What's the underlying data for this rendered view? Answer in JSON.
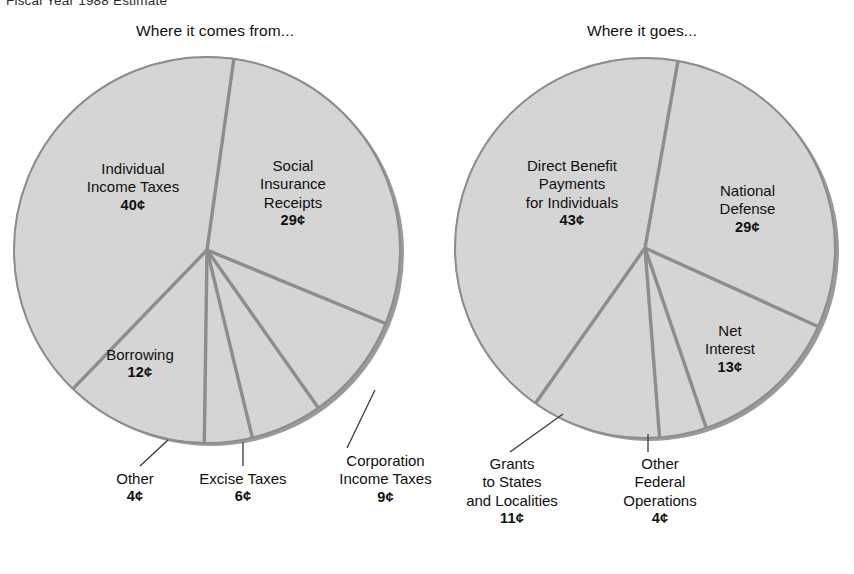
{
  "page": {
    "fiscal_note": "Fiscal Year 1988 Estimate",
    "background_color": "#ffffff",
    "pie_fill_color": "#d5d5d5",
    "pie_divider_color": "#8d8d8d",
    "pie_shadow_color": "#9a9a9a",
    "text_color": "#101010"
  },
  "chart_data": [
    {
      "type": "pie",
      "id": "where-it-comes-from",
      "title": "Where it comes from...",
      "unit": "¢",
      "total": 100,
      "center": [
        207,
        250
      ],
      "radius": 193,
      "categories": [
        "Social Insurance Receipts",
        "Corporation Income Taxes",
        "Excise Taxes",
        "Other",
        "Borrowing",
        "Individual Income Taxes"
      ],
      "values": [
        29,
        9,
        6,
        4,
        12,
        40
      ],
      "slices": [
        {
          "label": "Social Insurance Receipts",
          "label_lines": [
            "Social",
            "Insurance",
            "Receipts"
          ],
          "value": 29,
          "value_text": "29¢",
          "start_angle": 8,
          "end_angle": 112.4,
          "label_placement": "inside"
        },
        {
          "label": "Corporation Income Taxes",
          "label_lines": [
            "Corporation",
            "Income Taxes"
          ],
          "value": 9,
          "value_text": "9¢",
          "start_angle": 112.4,
          "end_angle": 144.8,
          "label_placement": "callout"
        },
        {
          "label": "Excise Taxes",
          "label_lines": [
            "Excise Taxes"
          ],
          "value": 6,
          "value_text": "6¢",
          "start_angle": 144.8,
          "end_angle": 166.4,
          "label_placement": "callout"
        },
        {
          "label": "Other",
          "label_lines": [
            "Other"
          ],
          "value": 4,
          "value_text": "4¢",
          "start_angle": 166.4,
          "end_angle": 180.8,
          "label_placement": "callout"
        },
        {
          "label": "Borrowing",
          "label_lines": [
            "Borrowing"
          ],
          "value": 12,
          "value_text": "12¢",
          "start_angle": 180.8,
          "end_angle": 224,
          "label_placement": "inside"
        },
        {
          "label": "Individual Income Taxes",
          "label_lines": [
            "Individual",
            "Income Taxes"
          ],
          "value": 40,
          "value_text": "40¢",
          "start_angle": 224,
          "end_angle": 368,
          "label_placement": "inside"
        }
      ]
    },
    {
      "type": "pie",
      "id": "where-it-goes",
      "title": "Where it goes...",
      "unit": "¢",
      "total": 100,
      "center": [
        645,
        248
      ],
      "radius": 190,
      "categories": [
        "National Defense",
        "Net Interest",
        "Other Federal Operations",
        "Grants to States and Localities",
        "Direct Benefit Payments for Individuals"
      ],
      "values": [
        29,
        13,
        4,
        11,
        43
      ],
      "slices": [
        {
          "label": "National Defense",
          "label_lines": [
            "National",
            "Defense"
          ],
          "value": 29,
          "value_text": "29¢",
          "start_angle": 10,
          "end_angle": 114.4,
          "label_placement": "inside"
        },
        {
          "label": "Net Interest",
          "label_lines": [
            "Net",
            "Interest"
          ],
          "value": 13,
          "value_text": "13¢",
          "start_angle": 114.4,
          "end_angle": 161.2,
          "label_placement": "inside"
        },
        {
          "label": "Other Federal Operations",
          "label_lines": [
            "Other",
            "Federal",
            "Operations"
          ],
          "value": 4,
          "value_text": "4¢",
          "start_angle": 161.2,
          "end_angle": 175.6,
          "label_placement": "callout"
        },
        {
          "label": "Grants to States and Localities",
          "label_lines": [
            "Grants",
            "to States",
            "and Localities"
          ],
          "value": 11,
          "value_text": "11¢",
          "start_angle": 175.6,
          "end_angle": 215.2,
          "label_placement": "callout"
        },
        {
          "label": "Direct Benefit Payments for Individuals",
          "label_lines": [
            "Direct Benefit",
            "Payments",
            "for Individuals"
          ],
          "value": 43,
          "value_text": "43¢",
          "start_angle": 215.2,
          "end_angle": 370,
          "label_placement": "inside"
        }
      ]
    }
  ],
  "labels": {
    "left": {
      "individual": {
        "l1": "Individual",
        "l2": "Income Taxes",
        "val": "40¢"
      },
      "social": {
        "l1": "Social",
        "l2": "Insurance",
        "l3": "Receipts",
        "val": "29¢"
      },
      "borrowing": {
        "l1": "Borrowing",
        "val": "12¢"
      },
      "other": {
        "l1": "Other",
        "val": "4¢"
      },
      "excise": {
        "l1": "Excise Taxes",
        "val": "6¢"
      },
      "corporation": {
        "l1": "Corporation",
        "l2": "Income Taxes",
        "val": "9¢"
      }
    },
    "right": {
      "direct": {
        "l1": "Direct Benefit",
        "l2": "Payments",
        "l3": "for Individuals",
        "val": "43¢"
      },
      "defense": {
        "l1": "National",
        "l2": "Defense",
        "val": "29¢"
      },
      "netinterest": {
        "l1": "Net",
        "l2": "Interest",
        "val": "13¢"
      },
      "grants": {
        "l1": "Grants",
        "l2": "to States",
        "l3": "and Localities",
        "val": "11¢"
      },
      "otherfed": {
        "l1": "Other",
        "l2": "Federal",
        "l3": "Operations",
        "val": "4¢"
      }
    }
  }
}
